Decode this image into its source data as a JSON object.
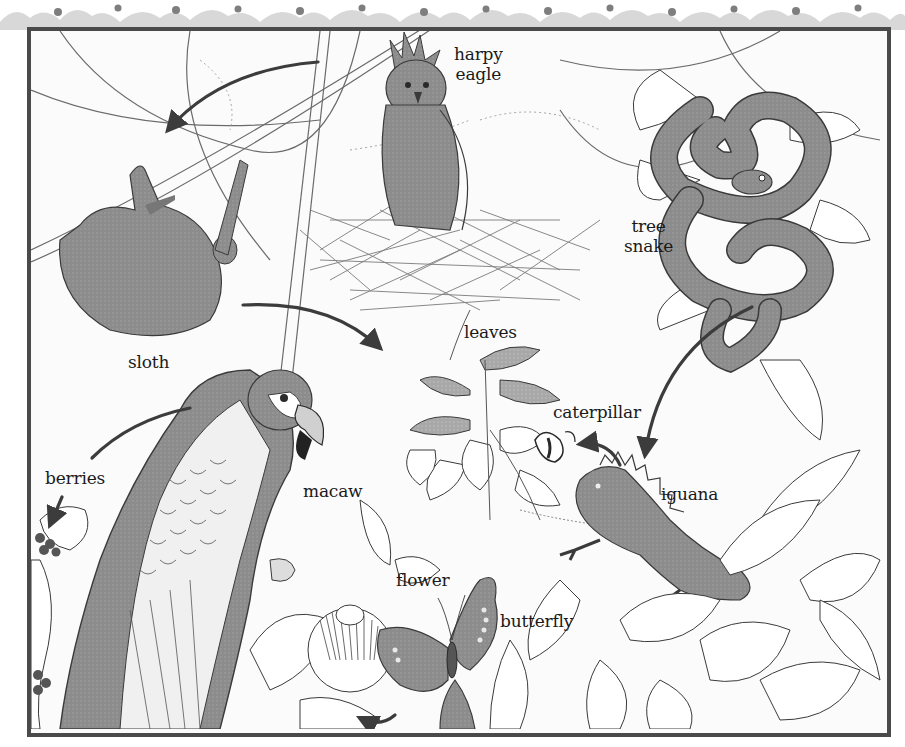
{
  "diagram": {
    "type": "food-web",
    "theme": "rainforest",
    "colors": {
      "frame": "#4a4a4a",
      "organism_fill": "#8a8a8a",
      "line": "#3a3a3a",
      "arrow": "#3c3c3c",
      "background": "#fbfbfb",
      "decor": "#b5b5b5"
    },
    "labels": {
      "harpy_eagle": [
        "harpy",
        "eagle"
      ],
      "tree_snake": [
        "tree",
        "snake"
      ],
      "sloth": "sloth",
      "leaves": "leaves",
      "caterpillar": "caterpillar",
      "berries": "berries",
      "macaw": "macaw",
      "iguana": "iguana",
      "flower": "flower",
      "butterfly": "butterfly"
    },
    "nodes": [
      {
        "id": "harpy_eagle",
        "label": "harpy eagle"
      },
      {
        "id": "tree_snake",
        "label": "tree snake"
      },
      {
        "id": "sloth",
        "label": "sloth"
      },
      {
        "id": "leaves",
        "label": "leaves"
      },
      {
        "id": "caterpillar",
        "label": "caterpillar"
      },
      {
        "id": "berries",
        "label": "berries"
      },
      {
        "id": "macaw",
        "label": "macaw"
      },
      {
        "id": "iguana",
        "label": "iguana"
      },
      {
        "id": "flower",
        "label": "flower"
      },
      {
        "id": "butterfly",
        "label": "butterfly"
      }
    ],
    "arrows": [
      {
        "from": "harpy_eagle",
        "to": "sloth"
      },
      {
        "from": "sloth",
        "to": "leaves"
      },
      {
        "from": "tree_snake",
        "to": "iguana"
      },
      {
        "from": "iguana",
        "to": "caterpillar"
      },
      {
        "from": "macaw",
        "to": "berries"
      },
      {
        "from": "butterfly",
        "to": "flower"
      }
    ]
  }
}
